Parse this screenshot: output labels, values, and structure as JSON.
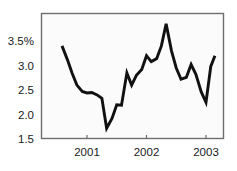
{
  "chart_data": {
    "type": "line",
    "title": "",
    "subtitle": "",
    "xlabel": "",
    "ylabel": "",
    "ylim": [
      1.5,
      4.0
    ],
    "xlim": [
      2000.55,
      2003.18
    ],
    "grid": false,
    "legend": null,
    "annotations": [],
    "y_tick_labels": [
      "3.5%",
      "3.0",
      "2.5",
      "2.0",
      "1.5"
    ],
    "y_tick_values": [
      3.5,
      3.0,
      2.5,
      2.0,
      1.5
    ],
    "x_tick_labels": [
      "2001",
      "2002",
      "2003"
    ],
    "x_tick_values": [
      2001,
      2002,
      2003
    ],
    "series": [
      {
        "name": "series-1",
        "color": "#111111",
        "x": [
          2000.58,
          2000.67,
          2000.75,
          2000.83,
          2000.92,
          2001.0,
          2001.08,
          2001.17,
          2001.25,
          2001.33,
          2001.42,
          2001.5,
          2001.58,
          2001.67,
          2001.75,
          2001.83,
          2001.92,
          2002.0,
          2002.08,
          2002.17,
          2002.25,
          2002.33,
          2002.42,
          2002.5,
          2002.58,
          2002.67,
          2002.75,
          2002.83,
          2002.92,
          2003.0,
          2003.08,
          2003.15
        ],
        "values": [
          3.4,
          3.12,
          2.84,
          2.6,
          2.47,
          2.44,
          2.45,
          2.4,
          2.33,
          1.72,
          1.92,
          2.2,
          2.19,
          2.85,
          2.6,
          2.8,
          2.92,
          3.2,
          3.08,
          3.14,
          3.4,
          3.85,
          3.3,
          2.95,
          2.72,
          2.76,
          3.02,
          2.82,
          2.46,
          2.25,
          2.98,
          3.2
        ]
      }
    ]
  },
  "plot": {
    "left": 41,
    "right": 224,
    "top": 13,
    "bottom": 139,
    "background_color": "#fbfbfb",
    "border_color": "#6e6e6e"
  }
}
